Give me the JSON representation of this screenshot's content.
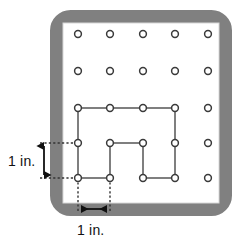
{
  "figure": {
    "kind": "geoboard-diagram",
    "board": {
      "name": "geoboard",
      "frame_color": "#808080",
      "face_color": "#ffffff",
      "x": 50,
      "y": 10,
      "width": 182,
      "height": 206,
      "corner_radius": 20,
      "frame_thickness": 13
    },
    "grid": {
      "rows": 5,
      "cols": 5,
      "spacing_label": "1 in.",
      "peg_columns_x": [
        78,
        110,
        143,
        175,
        208
      ],
      "peg_rows_y": [
        34,
        71,
        108,
        143,
        178
      ],
      "peg_outer_radius": 3.6,
      "peg_fill": "#ffffff",
      "peg_stroke": "#3a3a3a"
    },
    "polygon": {
      "name": "rubber-band-polygon",
      "stroke": "#555555",
      "stroke_width": 1.4,
      "fill": "none",
      "vertices": [
        {
          "col": 0,
          "row": 2,
          "x": 78,
          "y": 108
        },
        {
          "col": 3,
          "row": 2,
          "x": 175,
          "y": 108
        },
        {
          "col": 3,
          "row": 4,
          "x": 175,
          "y": 178
        },
        {
          "col": 2,
          "row": 4,
          "x": 143,
          "y": 178
        },
        {
          "col": 2,
          "row": 3,
          "x": 143,
          "y": 143
        },
        {
          "col": 1,
          "row": 3,
          "x": 110,
          "y": 143
        },
        {
          "col": 1,
          "row": 4,
          "x": 110,
          "y": 178
        },
        {
          "col": 0,
          "row": 4,
          "x": 78,
          "y": 178
        }
      ],
      "on_edge_pegs": [
        {
          "x": 110,
          "y": 108
        },
        {
          "x": 143,
          "y": 108
        },
        {
          "x": 175,
          "y": 143
        }
      ]
    },
    "measurements": [
      {
        "name": "vertical-measure",
        "label": "1 in.",
        "orientation": "vertical",
        "from": {
          "x": 78,
          "y": 143
        },
        "to": {
          "x": 78,
          "y": 178
        },
        "arrow_x": 44,
        "guide_color": "#333333",
        "guide_style": "dotted"
      },
      {
        "name": "horizontal-measure",
        "label": "1 in.",
        "orientation": "horizontal",
        "from": {
          "x": 78,
          "y": 178
        },
        "to": {
          "x": 110,
          "y": 178
        },
        "arrow_y": 209,
        "guide_color": "#333333",
        "guide_style": "dotted"
      }
    ]
  },
  "labels": {
    "vertical": "1 in.",
    "horizontal": "1 in."
  }
}
